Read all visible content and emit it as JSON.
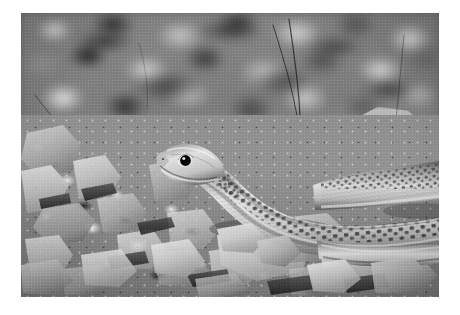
{
  "image": {
    "type": "photograph",
    "subject": "snake",
    "description": "Black-and-white close-up photograph of a slender snake resting on dry rocky gravel ground",
    "color_mode": "grayscale",
    "orientation": "landscape",
    "canvas": {
      "width": 460,
      "height": 315,
      "background": "#ffffff"
    },
    "photo_frame": {
      "x": 21,
      "y": 13,
      "width": 418,
      "height": 284,
      "border_color": "#ffffff"
    },
    "caption": ""
  },
  "palette": {
    "white_border": "#ffffff",
    "highlight": "#ececec",
    "light_gray": "#cfcfcf",
    "mid_gray": "#8c8c8c",
    "dark_gray": "#4a4a4a",
    "shadow": "#121212",
    "snake_body": "#b5b5b5",
    "snake_pattern": "#3c3c3c",
    "snake_eye": "#0d0d0d",
    "rock_light": "#b9b9b9"
  },
  "scene": {
    "focus": "shallow depth of field, sharp foreground, blurred background",
    "lighting": "bright natural daylight from upper left",
    "ground": "dry crushed limestone gravel and angular rock fragments",
    "regions": [
      {
        "name": "blurred-background-gravel",
        "position": "upper half",
        "tone": "mid to dark gray"
      },
      {
        "name": "large-pale-rock",
        "position": "upper right",
        "tone": "light gray"
      },
      {
        "name": "grass-stems",
        "position": "upper center-right",
        "tone": "dark thin lines"
      },
      {
        "name": "sharp-foreground-gravel",
        "position": "lower half",
        "tone": "high contrast light and dark"
      }
    ]
  },
  "subject": {
    "label": "snake",
    "pose": "head raised at left, body curving back to the right and looping toward the lower right",
    "head": {
      "x": 183,
      "y": 152,
      "facing": "left"
    },
    "eye": {
      "x": 184,
      "y": 151,
      "radius": 4,
      "color": "#0d0d0d",
      "highlight": true
    },
    "pattern": "rows of dark squarish checker spots along the dorsal scales, pale smooth head and neck",
    "scale_texture": "fine overlapping keeled scales",
    "segments": [
      {
        "name": "head-and-neck",
        "from": [
          170,
          150
        ],
        "to": [
          250,
          200
        ]
      },
      {
        "name": "mid-body",
        "from": [
          250,
          200
        ],
        "to": [
          360,
          215
        ]
      },
      {
        "name": "upper-coil",
        "from": [
          330,
          190
        ],
        "to": [
          439,
          180
        ]
      },
      {
        "name": "lower-coil",
        "from": [
          300,
          240
        ],
        "to": [
          439,
          225
        ]
      }
    ]
  },
  "grass_stems": [
    {
      "id": "stem-1",
      "path": "M 292 20 C 296 60, 302 100, 300 142"
    },
    {
      "id": "stem-2",
      "path": "M 275 26 C 286 62, 297 96, 300 140"
    },
    {
      "id": "stem-3",
      "path": "M 404 36 C 400 78, 396 118, 392 160"
    },
    {
      "id": "stem-4",
      "path": "M 58 120 C 62 136, 70 150, 80 162"
    },
    {
      "id": "stem-5",
      "path": "M 34 96 C 44 112, 52 126, 60 140"
    }
  ]
}
